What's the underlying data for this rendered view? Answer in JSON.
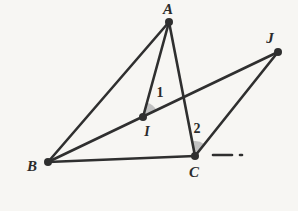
{
  "figure": {
    "canvas": {
      "width": 298,
      "height": 211
    },
    "background_color": "#f7f6f3",
    "ink_color": "#2f2f2f",
    "angle_fill_color": "#b9b9b9",
    "line_width": 2.6
  },
  "points": [
    {
      "id": "A",
      "label": "A",
      "x": 169,
      "y": 22,
      "label_x": 168,
      "label_y": 9,
      "font_size": 15
    },
    {
      "id": "B",
      "label": "B",
      "x": 48,
      "y": 162,
      "label_x": 32,
      "label_y": 166,
      "font_size": 15
    },
    {
      "id": "C",
      "label": "C",
      "x": 195,
      "y": 156,
      "label_x": 194,
      "label_y": 172,
      "font_size": 15
    },
    {
      "id": "I",
      "label": "I",
      "x": 143,
      "y": 117,
      "label_x": 147,
      "label_y": 132,
      "font_size": 14
    },
    {
      "id": "J",
      "label": "J",
      "x": 278,
      "y": 52,
      "label_x": 270,
      "label_y": 38,
      "font_size": 15
    }
  ],
  "segments": [
    {
      "id": "AB",
      "from": "A",
      "to": "B",
      "style": "solid"
    },
    {
      "id": "AI",
      "from": "A",
      "to": "I",
      "style": "solid"
    },
    {
      "id": "AC",
      "from": "A",
      "to": "C",
      "style": "solid"
    },
    {
      "id": "BC",
      "from": "B",
      "to": "C",
      "style": "solid"
    },
    {
      "id": "BJ",
      "from": "B",
      "to": "J",
      "style": "solid"
    },
    {
      "id": "CJ",
      "from": "C",
      "to": "J",
      "style": "solid"
    }
  ],
  "dashes": [
    {
      "id": "C-extension-dash",
      "x1": 213,
      "y1": 155,
      "x2": 232,
      "y2": 155
    },
    {
      "id": "C-extension-dot",
      "x1": 240,
      "y1": 155,
      "x2": 242,
      "y2": 155
    }
  ],
  "angles": [
    {
      "id": "angle-1",
      "label": "1",
      "vertex": "I",
      "between": [
        "A",
        "J"
      ],
      "radius": 15,
      "label_x": 160,
      "label_y": 93,
      "font_size": 14,
      "shaded": true
    },
    {
      "id": "angle-2",
      "label": "2",
      "vertex": "C",
      "between": [
        "A",
        "J"
      ],
      "radius": 15,
      "label_x": 197,
      "label_y": 129,
      "font_size": 14,
      "shaded": true
    }
  ]
}
